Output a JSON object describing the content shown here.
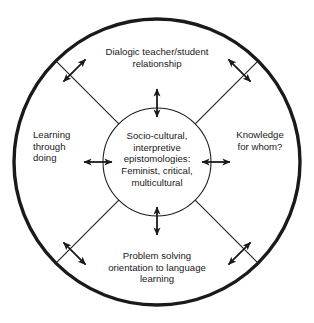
{
  "figure": {
    "type": "concentric-circle-conceptual-diagram",
    "background_color": "#ffffff",
    "line_color": "#1a1a1a"
  },
  "center": {
    "text": "Socio-cultural,\ninterpretive\nepistomologies:\nFeminist, critical,\nmulticultural",
    "lines": [
      "Socio-cultural,",
      "interpretive",
      "epistomologies:",
      "Feminist, critical,",
      "multicultural"
    ]
  },
  "labels": {
    "top": {
      "text": "Dialogic teacher/student\nrelationship",
      "lines": [
        "Dialogic teacher/student",
        "relationship"
      ]
    },
    "right": {
      "text": "Knowledge\nfor whom?",
      "lines": [
        "Knowledge",
        "for whom?"
      ]
    },
    "bottom": {
      "text": "Problem solving\norientation to language\nlearning",
      "lines": [
        "Problem solving",
        "orientation to language",
        "learning"
      ]
    },
    "left": {
      "text": "Learning\nthrough\ndoing",
      "lines": [
        "Learning",
        "through",
        "doing"
      ]
    }
  },
  "geometry": {
    "center_x": 157,
    "center_y": 162,
    "outer_radius": 143,
    "inner_radius": 54,
    "outer_stroke_width": 3.4,
    "inner_stroke_width": 1.0,
    "spoke_stroke_width": 1.0,
    "arrow_stroke_width": 1.3
  }
}
